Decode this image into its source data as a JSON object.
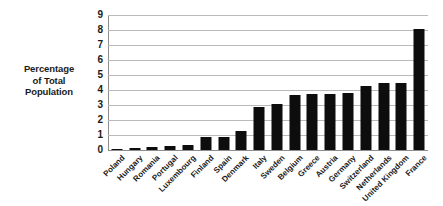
{
  "chart_data": {
    "type": "bar",
    "title": "",
    "subtitle": "",
    "xlabel": "",
    "ylabel": "Percentage of Total Population",
    "ylabel_lines": [
      "Percentage",
      "of Total",
      "Population"
    ],
    "ylim": [
      0,
      9
    ],
    "yticks": [
      0,
      1,
      2,
      3,
      4,
      5,
      6,
      7,
      8,
      9
    ],
    "ytick_labels": [
      "0",
      "1",
      "2",
      "3",
      "4",
      "5",
      "6",
      "7",
      "8",
      "9"
    ],
    "grid": true,
    "grid_axis": "y",
    "legend": false,
    "legend_position": "none",
    "bar_color": "#0d0d0d",
    "gridline_color": "#b9b9b9",
    "categories": [
      "Poland",
      "Hungary",
      "Romania",
      "Portugal",
      "Luxembourg",
      "Finland",
      "Spain",
      "Denmark",
      "Italy",
      "Sweden",
      "Belgium",
      "Greece",
      "Austria",
      "Germany",
      "Switzerland",
      "Netherlands",
      "United Kingdom",
      "France"
    ],
    "values": [
      0.02,
      0.15,
      0.2,
      0.3,
      0.35,
      0.85,
      0.9,
      1.25,
      2.85,
      3.1,
      3.7,
      3.75,
      3.75,
      3.78,
      4.25,
      4.45,
      4.5,
      8.1
    ]
  }
}
